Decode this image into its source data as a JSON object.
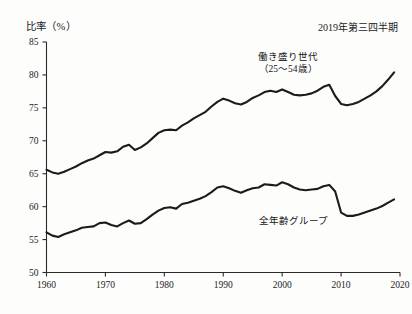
{
  "chart_data": {
    "type": "line",
    "title": "比率（%）",
    "annotation": "2019年第三四半期",
    "xlabel": "年",
    "ylabel": "比率（%）",
    "xlim": [
      1960,
      2020
    ],
    "ylim": [
      50,
      85
    ],
    "grid": false,
    "legend_position": "inline-annotation",
    "y_ticks": [
      "85",
      "80",
      "75",
      "70",
      "65",
      "60",
      "55",
      "50"
    ],
    "y_tick_values": [
      85,
      80,
      75,
      70,
      65,
      60,
      55,
      50
    ],
    "x_ticks": [
      "1960",
      "1970",
      "1980",
      "1990",
      "2000",
      "2010",
      "2020"
    ],
    "x_tick_values": [
      1960,
      1970,
      1980,
      1990,
      2000,
      2010,
      2020
    ],
    "x_axis_unit": "年",
    "series": [
      {
        "name": "働き盛り世代（25〜54歳）",
        "label_line1": "働き盛り世代",
        "label_line2": "（25〜54歳）",
        "x": [
          1960,
          1961,
          1962,
          1963,
          1964,
          1965,
          1966,
          1967,
          1968,
          1969,
          1970,
          1971,
          1972,
          1973,
          1974,
          1975,
          1976,
          1977,
          1978,
          1979,
          1980,
          1981,
          1982,
          1983,
          1984,
          1985,
          1986,
          1987,
          1988,
          1989,
          1990,
          1991,
          1992,
          1993,
          1994,
          1995,
          1996,
          1997,
          1998,
          1999,
          2000,
          2001,
          2002,
          2003,
          2004,
          2005,
          2006,
          2007,
          2008,
          2009,
          2010,
          2011,
          2012,
          2013,
          2014,
          2015,
          2016,
          2017,
          2018,
          2019
        ],
        "values": [
          65.6,
          65.2,
          65.0,
          65.3,
          65.7,
          66.1,
          66.6,
          67.0,
          67.3,
          67.8,
          68.3,
          68.2,
          68.4,
          69.1,
          69.4,
          68.6,
          69.0,
          69.6,
          70.4,
          71.2,
          71.6,
          71.7,
          71.6,
          72.3,
          72.8,
          73.4,
          73.9,
          74.4,
          75.2,
          75.9,
          76.4,
          76.1,
          75.7,
          75.5,
          75.9,
          76.5,
          76.9,
          77.4,
          77.6,
          77.4,
          77.8,
          77.4,
          77.0,
          76.9,
          77.0,
          77.2,
          77.6,
          78.2,
          78.5,
          76.8,
          75.6,
          75.4,
          75.6,
          75.9,
          76.4,
          76.9,
          77.5,
          78.3,
          79.3,
          80.4
        ],
        "start_value": 65.6,
        "peak_value": 80.4,
        "trough_2010": 75.4
      },
      {
        "name": "全年齢グループ",
        "label_line1": "全年齢グループ",
        "x": [
          1960,
          1961,
          1962,
          1963,
          1964,
          1965,
          1966,
          1967,
          1968,
          1969,
          1970,
          1971,
          1972,
          1973,
          1974,
          1975,
          1976,
          1977,
          1978,
          1979,
          1980,
          1981,
          1982,
          1983,
          1984,
          1985,
          1986,
          1987,
          1988,
          1989,
          1990,
          1991,
          1992,
          1993,
          1994,
          1995,
          1996,
          1997,
          1998,
          1999,
          2000,
          2001,
          2002,
          2003,
          2004,
          2005,
          2006,
          2007,
          2008,
          2009,
          2010,
          2011,
          2012,
          2013,
          2014,
          2015,
          2016,
          2017,
          2018,
          2019
        ],
        "values": [
          56.1,
          55.6,
          55.4,
          55.8,
          56.1,
          56.4,
          56.8,
          56.9,
          57.0,
          57.5,
          57.6,
          57.2,
          57.0,
          57.5,
          57.9,
          57.4,
          57.5,
          58.1,
          58.8,
          59.4,
          59.8,
          59.9,
          59.7,
          60.4,
          60.6,
          60.9,
          61.2,
          61.6,
          62.2,
          62.9,
          63.1,
          62.8,
          62.4,
          62.1,
          62.5,
          62.8,
          62.9,
          63.4,
          63.3,
          63.2,
          63.7,
          63.4,
          62.9,
          62.6,
          62.5,
          62.6,
          62.7,
          63.1,
          63.3,
          62.3,
          59.1,
          58.6,
          58.6,
          58.8,
          59.1,
          59.4,
          59.7,
          60.1,
          60.6,
          61.1
        ],
        "start_value": 56.1,
        "peak_value": 63.7,
        "trough_2010": 58.6
      }
    ]
  },
  "header": {
    "y_axis_title": "比率（%）",
    "period_note": "2019年第三四半期"
  },
  "axis": {
    "x_unit_label": "年"
  },
  "labels": {
    "prime_line1": "働き盛り世代",
    "prime_line2": "（25〜54歳）",
    "all_ages": "全年齢グループ"
  }
}
